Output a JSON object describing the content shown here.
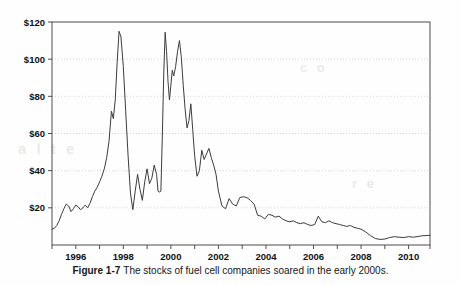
{
  "figure": {
    "caption_label": "Figure 1-7",
    "caption_text": "The stocks of fuel cell companies soared in the early 2000s.",
    "ghost_text_a": "a l t e",
    "ghost_text_b": "c o",
    "ghost_text_c": "r e"
  },
  "colors": {
    "background": "#fefefe",
    "axis": "#4d4d4d",
    "gridline": "#c9c9c9",
    "series_line": "#3c3c3c",
    "tick_label": "#111111",
    "caption": "#161616"
  },
  "chart_data": {
    "type": "line",
    "title": "",
    "xlabel": "",
    "ylabel": "",
    "xlim": [
      1995.0,
      2010.9
    ],
    "ylim": [
      0,
      120
    ],
    "grid": true,
    "grid_axis": "y",
    "legend": "none",
    "x_ticks": [
      1996,
      1998,
      2000,
      2002,
      2004,
      2006,
      2008,
      2010
    ],
    "x_tick_labels": [
      "1996",
      "1998",
      "2000",
      "2002",
      "2004",
      "2006",
      "2008",
      "2010"
    ],
    "x_minor_ticks": [
      1995,
      1997,
      1999,
      2001,
      2003,
      2005,
      2007,
      2009,
      2010.9
    ],
    "y_ticks": [
      20,
      40,
      60,
      80,
      100,
      120
    ],
    "y_tick_labels": [
      "$20",
      "$40",
      "$60",
      "$80",
      "$100",
      "$120"
    ],
    "series": [
      {
        "name": "Fuel cell company stock index",
        "x": [
          1995.0,
          1995.1,
          1995.2,
          1995.3,
          1995.4,
          1995.5,
          1995.6,
          1995.7,
          1995.8,
          1995.9,
          1996.0,
          1996.1,
          1996.2,
          1996.3,
          1996.4,
          1996.5,
          1996.6,
          1996.7,
          1996.8,
          1996.9,
          1997.0,
          1997.1,
          1997.2,
          1997.3,
          1997.4,
          1997.5,
          1997.58,
          1997.66,
          1997.74,
          1997.82,
          1997.9,
          1998.0,
          1998.1,
          1998.2,
          1998.3,
          1998.4,
          1998.5,
          1998.6,
          1998.7,
          1998.8,
          1998.9,
          1999.0,
          1999.1,
          1999.2,
          1999.3,
          1999.4,
          1999.46,
          1999.52,
          1999.58,
          1999.64,
          1999.7,
          1999.76,
          1999.82,
          1999.88,
          1999.94,
          2000.0,
          2000.06,
          2000.12,
          2000.2,
          2000.28,
          2000.36,
          2000.44,
          2000.52,
          2000.6,
          2000.68,
          2000.76,
          2000.84,
          2000.92,
          2001.0,
          2001.1,
          2001.2,
          2001.3,
          2001.4,
          2001.5,
          2001.6,
          2001.7,
          2001.8,
          2001.9,
          2002.0,
          2002.15,
          2002.3,
          2002.45,
          2002.6,
          2002.75,
          2002.9,
          2003.05,
          2003.2,
          2003.35,
          2003.5,
          2003.65,
          2003.8,
          2003.95,
          2004.1,
          2004.25,
          2004.4,
          2004.55,
          2004.7,
          2004.85,
          2005.0,
          2005.15,
          2005.3,
          2005.45,
          2005.6,
          2005.75,
          2005.9,
          2006.05,
          2006.2,
          2006.35,
          2006.5,
          2006.65,
          2006.8,
          2006.95,
          2007.1,
          2007.25,
          2007.4,
          2007.55,
          2007.7,
          2007.85,
          2008.0,
          2008.2,
          2008.4,
          2008.6,
          2008.8,
          2009.0,
          2009.2,
          2009.4,
          2009.6,
          2009.8,
          2010.0,
          2010.2,
          2010.4,
          2010.6,
          2010.9
        ],
        "y": [
          8.5,
          9.0,
          10.5,
          13.0,
          16.5,
          19.5,
          22.0,
          21.0,
          18.0,
          19.5,
          21.5,
          20.5,
          19.0,
          20.0,
          21.5,
          20.0,
          22.5,
          26.0,
          29.0,
          31.0,
          34.0,
          37.0,
          41.0,
          47.0,
          56.0,
          72.0,
          68.0,
          78.0,
          98.0,
          115.0,
          112.0,
          96.0,
          72.0,
          48.0,
          28.0,
          19.0,
          29.0,
          38.0,
          30.0,
          24.0,
          34.0,
          41.0,
          33.0,
          36.0,
          43.0,
          38.0,
          29.0,
          28.5,
          29.0,
          58.0,
          92.0,
          114.5,
          104.0,
          88.0,
          78.0,
          86.0,
          94.0,
          91.0,
          96.0,
          104.0,
          110.0,
          101.0,
          86.0,
          73.0,
          63.0,
          67.0,
          76.0,
          62.0,
          48.0,
          37.0,
          40.0,
          51.0,
          46.0,
          49.0,
          52.0,
          47.0,
          43.0,
          38.0,
          29.0,
          21.0,
          19.5,
          25.0,
          22.0,
          21.0,
          25.5,
          26.0,
          25.5,
          24.0,
          22.0,
          16.0,
          15.5,
          14.0,
          16.5,
          16.0,
          15.0,
          15.5,
          14.0,
          13.0,
          12.5,
          13.0,
          12.0,
          11.5,
          12.0,
          11.0,
          10.5,
          11.0,
          15.5,
          12.5,
          12.0,
          13.0,
          12.0,
          11.5,
          11.0,
          10.5,
          10.0,
          10.5,
          9.5,
          9.0,
          8.5,
          7.0,
          5.0,
          3.5,
          3.0,
          3.2,
          4.0,
          4.5,
          4.2,
          4.0,
          4.5,
          4.2,
          4.6,
          5.0,
          5.2
        ]
      }
    ]
  }
}
